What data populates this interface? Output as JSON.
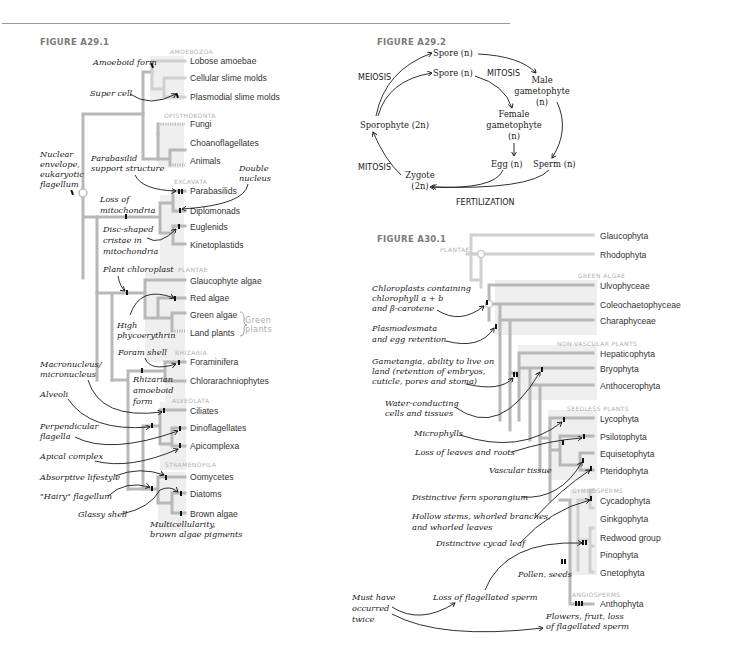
{
  "figures": {
    "a29_1": {
      "title": "FIGURE A29.1",
      "clades": {
        "amoebozoa": "AMOEBOZOA",
        "opisthokonta": "OPISTHOKONTA",
        "excavata": "EXCAVATA",
        "plantae": "PLANTAE",
        "rhizaria": "RHIZARIA",
        "alveolata": "ALVEOLATA",
        "stramenopila": "STRAMENOPILA"
      },
      "taxa": [
        "Lobose amoebae",
        "Cellular slime molds",
        "Plasmodial slime molds",
        "Fungi",
        "Choanoflagellates",
        "Animals",
        "Parabasilids",
        "Diplomonads",
        "Euglenids",
        "Kinetoplastids",
        "Glaucophyte algae",
        "Red algae",
        "Green algae",
        "Land plants",
        "Foraminifera",
        "Chlorarachniophytes",
        "Ciliates",
        "Dinoflagellates",
        "Apicomplexa",
        "Oomycetes",
        "Diatoms",
        "Brown algae"
      ],
      "bracket_label": [
        "Green",
        "plants"
      ],
      "annotations": {
        "amoeboid_form": "Amoeboid form",
        "super_cell": "Super cell",
        "nuclear": [
          "Nuclear",
          "envelope,",
          "eukaryotic",
          "flagellum"
        ],
        "parabasilid": [
          "Parabasilid",
          "support structure"
        ],
        "double_nucleus": [
          "Double",
          "nucleus"
        ],
        "loss_mito": [
          "Loss of",
          "mitochondria"
        ],
        "disc_cristae": [
          "Disc-shaped",
          "cristae in",
          "mitochondria"
        ],
        "plant_chloroplast": "Plant chloroplast",
        "high_phyco": [
          "High",
          "phycoerythrin"
        ],
        "foram_shell": "Foram shell",
        "macronucleus": [
          "Macronucleus/",
          "micronucleus"
        ],
        "rhizarian": [
          "Rhizarian",
          "amoeboid",
          "form"
        ],
        "alveoli": "Alveoli",
        "perpendicular": [
          "Perpendicular",
          "flagella"
        ],
        "apical": "Apical complex",
        "absorptive": "Absorptive lifestyle",
        "hairy": "\"Hairy\" flagellum",
        "glassy": "Glassy shell",
        "multicell": [
          "Multicellularity,",
          "brown algae pigments"
        ]
      }
    },
    "a29_2": {
      "title": "FIGURE A29.2",
      "nodes": {
        "spore1": "Spore (n)",
        "spore2": "Spore (n)",
        "male": [
          "Male",
          "gametophyte",
          "(n)"
        ],
        "female": [
          "Female",
          "gametophyte",
          "(n)"
        ],
        "egg": "Egg (n)",
        "sperm": "Sperm (n)",
        "zygote": [
          "Zygote",
          "(2n)"
        ],
        "sporophyte": "Sporophyte (2n)"
      },
      "processes": {
        "meiosis": "MEIOSIS",
        "mitosis_top": "MITOSIS",
        "mitosis_left": "MITOSIS",
        "fertilization": "FERTILIZATION"
      }
    },
    "a30_1": {
      "title": "FIGURE A30.1",
      "clades": {
        "plantae": "PLANTAE",
        "green_algae": "GREEN ALGAE",
        "non_vascular": "NON-VASCULAR PLANTS",
        "seedless": "SEEDLESS PLANTS",
        "gymnosperms": "GYMNOSPERMS",
        "angiosperms": "ANGIOSPERMS"
      },
      "taxa": [
        "Glaucophyta",
        "Rhodophyta",
        "Ulvophyceae",
        "Coleochaetophyceae",
        "Charaphyceae",
        "Hepaticophyta",
        "Bryophyta",
        "Anthocerophyta",
        "Lycophyta",
        "Psilotophyta",
        "Equisetophyta",
        "Pteridophyta",
        "Cycadophyta",
        "Ginkgophyta",
        "Redwood group",
        "Pinophyta",
        "Gnetophyta",
        "Anthophyta"
      ],
      "annotations": {
        "chloroplasts": [
          "Chloroplasts containing",
          "chlorophyll a + b",
          "and β-carotene"
        ],
        "plasmodesmata": [
          "Plasmodesmata",
          "and egg retention"
        ],
        "gametangia": [
          "Gametangia, ability to live on",
          "land (retention of embryos,",
          "cuticle, pores and stoma)"
        ],
        "water": [
          "Water-conducting",
          "cells and tissues"
        ],
        "microphylls": "Microphylls",
        "loss_leaves": "Loss of leaves and roots",
        "vascular": "Vascular tissue",
        "fern": "Distinctive fern sporangium",
        "hollow": [
          "Hollow stems, whorled branches,",
          "and whorled leaves"
        ],
        "cycad": "Distinctive cycad leaf",
        "pollen": "Pollen, seeds",
        "must_have": [
          "Must have",
          "occurred",
          "twice"
        ],
        "loss_flag": "Loss of flagellated sperm",
        "flowers": [
          "Flowers, fruit, loss",
          "of flagellated sperm"
        ]
      }
    }
  }
}
